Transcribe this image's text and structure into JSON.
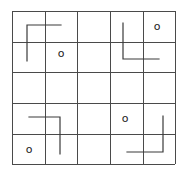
{
  "diagram": {
    "type": "grid-puzzle",
    "rows": 5,
    "cols": 5,
    "x_edges": [
      12,
      45,
      77,
      110,
      143,
      175
    ],
    "y_edges": [
      11,
      42,
      72,
      103,
      134,
      164
    ],
    "colors": {
      "grid": "#4a4a4a",
      "shape": "#3a3a3a",
      "marker": "#222222",
      "background": "#ffffff"
    },
    "l_shapes": [
      {
        "name": "top-left-l",
        "points": [
          [
            61,
            25
          ],
          [
            27,
            25
          ],
          [
            27,
            61
          ]
        ]
      },
      {
        "name": "top-right-l",
        "points": [
          [
            123,
            23
          ],
          [
            123,
            59
          ],
          [
            159,
            59
          ]
        ]
      },
      {
        "name": "bottom-left-l",
        "points": [
          [
            29,
            117
          ],
          [
            60,
            117
          ],
          [
            60,
            154
          ]
        ]
      },
      {
        "name": "bottom-right-l",
        "points": [
          [
            163,
            116
          ],
          [
            163,
            152
          ],
          [
            127,
            152
          ]
        ]
      }
    ],
    "markers": [
      {
        "name": "marker-r1c2",
        "label": "o",
        "x": 61,
        "y": 53
      },
      {
        "name": "marker-r0c4",
        "label": "o",
        "x": 157,
        "y": 26
      },
      {
        "name": "marker-r3c3",
        "label": "o",
        "x": 125,
        "y": 118
      },
      {
        "name": "marker-r4c0",
        "label": "o",
        "x": 29,
        "y": 149
      }
    ]
  }
}
